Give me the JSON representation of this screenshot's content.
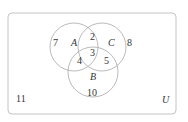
{
  "diagram": {
    "type": "venn",
    "universe_label": "U",
    "sets": [
      {
        "label": "A"
      },
      {
        "label": "B"
      },
      {
        "label": "C"
      }
    ],
    "regions": {
      "A_only": "7",
      "C_only": "8",
      "B_only": "10",
      "A_and_C_only": "2",
      "A_and_B_only": "4",
      "B_and_C_only": "5",
      "A_and_B_and_C": "3",
      "outside": "11"
    },
    "colors": {
      "stroke": "#b5b5b5",
      "text": "#333333",
      "background": "#ffffff"
    }
  }
}
